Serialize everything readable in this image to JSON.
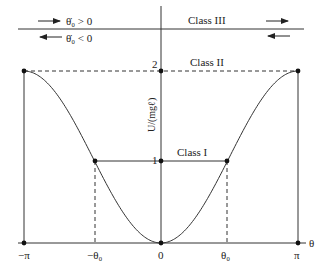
{
  "diagram": {
    "type": "potential-energy-plot",
    "function": "1 - cos(theta)",
    "ylabel": "U/(mgℓ)",
    "xlabel": "θ",
    "x_ticks": [
      {
        "value": -3.14159,
        "label": "−π"
      },
      {
        "value": -0.92,
        "label": "−θ₀"
      },
      {
        "value": 0,
        "label": "0"
      },
      {
        "value": 0.92,
        "label": "θ₀"
      },
      {
        "value": 3.14159,
        "label": "π"
      }
    ],
    "y_ticks": [
      {
        "value": 1,
        "label": "1"
      },
      {
        "value": 2,
        "label": "2"
      }
    ],
    "levels": [
      {
        "name": "Class I",
        "energy": 1
      },
      {
        "name": "Class II",
        "energy": 2
      },
      {
        "name": "Class III",
        "energy": "above 2"
      }
    ],
    "legend": {
      "positive": "θ̇₀ > 0",
      "negative": "θ̇₀ < 0"
    },
    "theta0": 0.92
  }
}
